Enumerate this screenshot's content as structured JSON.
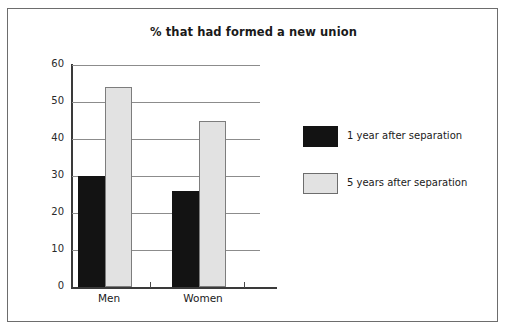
{
  "chart_data": {
    "type": "bar",
    "title": "% that had formed a new union",
    "xlabel": "",
    "ylabel": "",
    "categories": [
      "Men",
      "Women"
    ],
    "series": [
      {
        "name": "1 year after separation",
        "values": [
          30,
          26
        ],
        "color": "#131313"
      },
      {
        "name": "5 years after separation",
        "values": [
          54,
          45
        ],
        "color": "#e2e2e2"
      }
    ],
    "ylim": [
      0,
      60
    ],
    "yticks": [
      0,
      10,
      20,
      30,
      40,
      50,
      60
    ],
    "ytick_labels": [
      "0",
      "10",
      "20",
      "30",
      "40",
      "50",
      "60"
    ],
    "grid": true,
    "grid_axis": "y",
    "legend_position": "right"
  },
  "frame": {
    "border_color": "#6d6d6d",
    "background": "#ffffff"
  }
}
